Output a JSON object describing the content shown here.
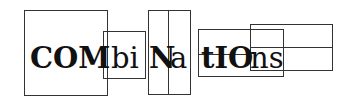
{
  "logo": {
    "segments": [
      {
        "text": "COM",
        "weight": "bold"
      },
      {
        "text": "bi",
        "weight": "normal"
      },
      {
        "text": "N",
        "weight": "bold"
      },
      {
        "text": "a",
        "weight": "normal"
      },
      {
        "text": "tIO",
        "weight": "bold"
      },
      {
        "text": "ns",
        "weight": "normal"
      }
    ],
    "full_text": "COMbiNatIOns"
  },
  "colors": {
    "stroke": "#333333",
    "text": "#111111",
    "background": "#ffffff"
  }
}
